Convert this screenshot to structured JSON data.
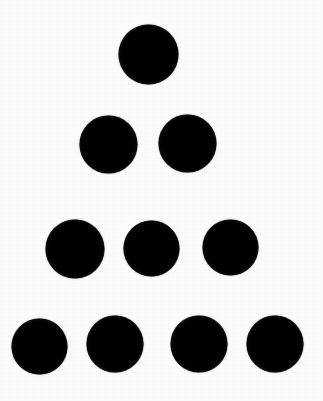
{
  "image": {
    "title": "Triangular Dot Arrangement",
    "description": "Ten solid black filled circles arranged in a triangular (tetractys) pattern of four rows: 1, 2, 3 and 4 dots from top to bottom, on a plain white background.",
    "width": 323,
    "height": 401,
    "background_color": "#ffffff",
    "dot_color": "#0f0f0f",
    "total_dots": 10,
    "row_count": 4
  },
  "rows": [
    {
      "index": 1,
      "count": 1,
      "center_y": 54
    },
    {
      "index": 2,
      "count": 2,
      "center_y": 144
    },
    {
      "index": 3,
      "count": 3,
      "center_y": 248
    },
    {
      "index": 4,
      "count": 4,
      "center_y": 345
    }
  ],
  "dots": [
    {
      "id": "dot-r1-c1",
      "row": 1,
      "col": 1,
      "cx": 148,
      "cy": 54,
      "d": 59
    },
    {
      "id": "dot-r2-c1",
      "row": 2,
      "col": 1,
      "cx": 108,
      "cy": 144,
      "d": 57
    },
    {
      "id": "dot-r2-c2",
      "row": 2,
      "col": 2,
      "cx": 187,
      "cy": 143,
      "d": 57
    },
    {
      "id": "dot-r3-c1",
      "row": 3,
      "col": 1,
      "cx": 75,
      "cy": 249,
      "d": 58
    },
    {
      "id": "dot-r3-c2",
      "row": 3,
      "col": 2,
      "cx": 151,
      "cy": 248,
      "d": 55
    },
    {
      "id": "dot-r3-c3",
      "row": 3,
      "col": 3,
      "cx": 230,
      "cy": 247,
      "d": 55
    },
    {
      "id": "dot-r4-c1",
      "row": 4,
      "col": 1,
      "cx": 39,
      "cy": 346,
      "d": 55
    },
    {
      "id": "dot-r4-c2",
      "row": 4,
      "col": 2,
      "cx": 115,
      "cy": 344,
      "d": 56
    },
    {
      "id": "dot-r4-c3",
      "row": 4,
      "col": 3,
      "cx": 199,
      "cy": 344,
      "d": 56
    },
    {
      "id": "dot-r4-c4",
      "row": 4,
      "col": 4,
      "cx": 275,
      "cy": 344,
      "d": 56
    }
  ]
}
